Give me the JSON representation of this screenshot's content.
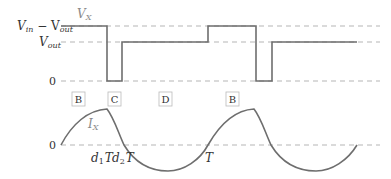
{
  "diagram": {
    "voltage_signal_label": "V",
    "voltage_signal_sub": "X",
    "current_signal_label": "I",
    "current_signal_sub": "X",
    "y_axis_voltage": {
      "top_label_main": "V",
      "top_label_sub1": "in",
      "top_label_minus": " − V",
      "top_label_sub2": "out",
      "mid_label_main": "V",
      "mid_label_sub": "out",
      "zero_label": "0"
    },
    "y_axis_current": {
      "zero_label": "0"
    },
    "phase_boxes": [
      "B",
      "C",
      "D",
      "B"
    ],
    "time_markers": {
      "d1T_main": "d",
      "d1T_sub": "1",
      "d1T_T": "T",
      "d2T_main": "d",
      "d2T_sub": "2",
      "d2T_T": "T",
      "T": "T"
    },
    "colors": {
      "signal": "#6e6e6e",
      "dashed": "#b5b5b5",
      "text": "#333333",
      "signal_label": "#8a8a8a"
    }
  }
}
